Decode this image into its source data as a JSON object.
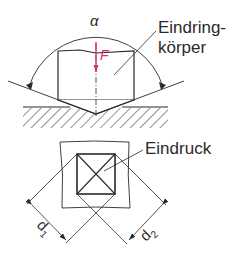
{
  "diagram": {
    "type": "vickers-hardness-test",
    "labels": {
      "angle": "α",
      "force": "F",
      "indenter_line1": "Eindring-",
      "indenter_line2": "körper",
      "impression": "Eindruck",
      "diagonal1": "d",
      "diagonal1_sub": "1",
      "diagonal2": "d",
      "diagonal2_sub": "2"
    },
    "colors": {
      "line": "#2a2a2a",
      "force_arrow": "#d6336c",
      "background": "#ffffff"
    }
  }
}
